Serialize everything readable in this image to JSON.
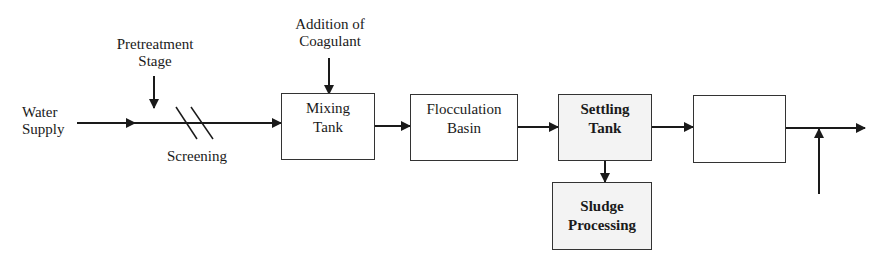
{
  "diagram": {
    "title": "",
    "type": "process-flow",
    "inputs": {
      "water_supply": [
        "Water",
        "Supply"
      ],
      "pretreatment": [
        "Pretreatment",
        "Stage"
      ],
      "coagulant": [
        "Addition of",
        "Coagulant"
      ],
      "screening": "Screening"
    },
    "nodes": [
      {
        "id": "mixing-tank",
        "lines": [
          "Mixing",
          "Tank"
        ],
        "shaded": false
      },
      {
        "id": "flocculation-basin",
        "lines": [
          "Flocculation",
          "Basin"
        ],
        "shaded": false
      },
      {
        "id": "settling-tank",
        "lines": [
          "Settling",
          "Tank"
        ],
        "shaded": true
      },
      {
        "id": "unlabeled-box",
        "lines": [
          "",
          ""
        ],
        "shaded": false
      },
      {
        "id": "sludge-processing",
        "lines": [
          "Sludge",
          "Processing"
        ],
        "shaded": true
      }
    ],
    "edges": [
      {
        "from": "water-supply",
        "to": "mixing-tank",
        "via": "screening"
      },
      {
        "from": "pretreatment-stage",
        "to": "main-line"
      },
      {
        "from": "coagulant",
        "to": "mixing-tank"
      },
      {
        "from": "mixing-tank",
        "to": "flocculation-basin"
      },
      {
        "from": "flocculation-basin",
        "to": "settling-tank"
      },
      {
        "from": "settling-tank",
        "to": "sludge-processing"
      },
      {
        "from": "settling-tank",
        "to": "unlabeled-box"
      },
      {
        "from": "unlabeled-box",
        "to": "output"
      },
      {
        "from": "side-input",
        "to": "output-line"
      }
    ],
    "colors": {
      "stroke": "#1a1a1a",
      "box_border": "#333333",
      "shaded_fill": "#f3f3f3",
      "background": "#ffffff"
    }
  }
}
